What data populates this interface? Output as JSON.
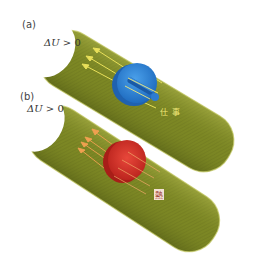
{
  "panels": [
    {
      "id": "a",
      "label": "(a)",
      "condition_symbol": "ΔU",
      "condition_relation": " > 0",
      "process_label": "仕事",
      "process_meaning": "work",
      "object": "piston",
      "object_color": "#2f86d6",
      "arrow_color": "#e9e05a",
      "tube_color": "#7f8a24"
    },
    {
      "id": "b",
      "label": "(b)",
      "condition_symbol": "ΔU",
      "condition_relation": " > 0",
      "process_label": "熱",
      "process_meaning": "heat",
      "object": "disc",
      "object_color": "#d8322a",
      "arrow_color": "#f0a050",
      "tube_color": "#7f8a24"
    }
  ]
}
